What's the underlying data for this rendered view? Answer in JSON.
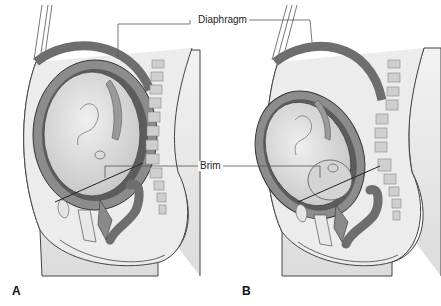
{
  "labels": {
    "diaphragm": "Diaphragm",
    "brim": "Brim"
  },
  "panels": [
    {
      "id": "A"
    },
    {
      "id": "B"
    }
  ],
  "colors": {
    "skin": "#e6e6e6",
    "muscle": "#7a7a7a",
    "uterus_wall": "#8c8c8c",
    "fetus": "#d9d9d9",
    "vertebra": "#c8c8c8",
    "rectum": "#6e6e6e",
    "outline": "#333333"
  }
}
